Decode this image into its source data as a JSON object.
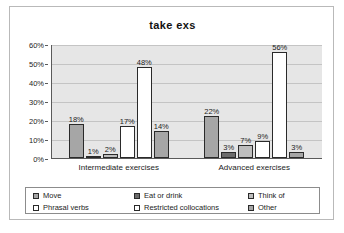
{
  "chart_data": {
    "type": "bar",
    "title": "take exs",
    "xlabel": "",
    "ylabel": "",
    "ylim": [
      0,
      60
    ],
    "ytick_labels": [
      "60%",
      "50%",
      "40%",
      "30%",
      "20%",
      "10%",
      "0%"
    ],
    "ytick_values": [
      60,
      50,
      40,
      30,
      20,
      10,
      0
    ],
    "grid": true,
    "legend_position": "bottom",
    "categories": [
      "Intermediate exercises",
      "Advanced exercises"
    ],
    "series": [
      {
        "name": "Move",
        "values": [
          18,
          22
        ],
        "color": "#a6a6a6"
      },
      {
        "name": "Eat or drink",
        "values": [
          1,
          3
        ],
        "color": "#6b6b6b"
      },
      {
        "name": "Think of",
        "values": [
          2,
          7
        ],
        "color": "#bdbdbd"
      },
      {
        "name": "Phrasal verbs",
        "values": [
          17,
          9
        ],
        "color": "#ffffff"
      },
      {
        "name": "Restricted collocations",
        "values": [
          48,
          56
        ],
        "color": "#ffffff"
      },
      {
        "name": "Other",
        "values": [
          14,
          3
        ],
        "color": "#a6a6a6"
      }
    ],
    "data_labels": {
      "Intermediate exercises": [
        "18%",
        "1%",
        "2%",
        "17%",
        "48%",
        "14%"
      ],
      "Advanced exercises": [
        "22%",
        "3%",
        "7%",
        "9%",
        "56%",
        "3%"
      ]
    },
    "plot_background": "#e6e6e6",
    "gridline_color": "#c4c4c4",
    "axis_color": "#5a5a5a",
    "bar_border_color": "#2a2a2a"
  },
  "legend": {
    "rows": [
      [
        {
          "label": "Move",
          "color": "#a6a6a6"
        },
        {
          "label": "Eat or drink",
          "color": "#6b6b6b"
        },
        {
          "label": "Think of",
          "color": "#bdbdbd"
        }
      ],
      [
        {
          "label": "Phrasal verbs",
          "color": "#ffffff"
        },
        {
          "label": "Restricted collocations",
          "color": "#ffffff"
        },
        {
          "label": "Other",
          "color": "#a6a6a6"
        }
      ]
    ]
  }
}
